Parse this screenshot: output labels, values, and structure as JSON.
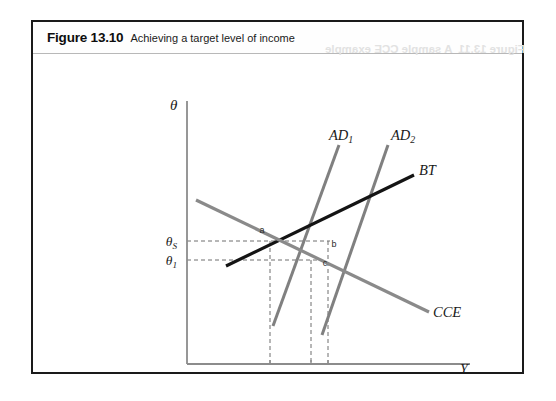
{
  "figure": {
    "number": "Figure 13.10",
    "title": "Achieving a target level of income",
    "bleed_through_text": "Figure 13.11  A sample CCE example"
  },
  "axes": {
    "y_axis_label": "θ",
    "x_axis_label": "Y",
    "axis_color": "#8c8c8c",
    "origin": [
      154,
      341
    ],
    "x_axis_end": [
      437,
      341
    ],
    "y_axis_top": [
      154,
      78
    ]
  },
  "y_ticks": [
    {
      "name": "theta-S",
      "label": "θ",
      "sub": "S",
      "y": 218,
      "label_x": 132
    },
    {
      "name": "theta-1",
      "label": "θ",
      "sub": "1",
      "y": 237,
      "label_x": 132
    }
  ],
  "x_ticks": [
    {
      "name": "Y-S",
      "label": "Y",
      "sub": "S",
      "x": 237,
      "label_y": 358
    },
    {
      "name": "Y-1",
      "label": "Y",
      "sub": "1",
      "x": 278,
      "label_y": 358
    },
    {
      "name": "Y-T",
      "label": "Y",
      "sub": "T",
      "x": 295,
      "label_y": 358
    }
  ],
  "curves": [
    {
      "id": "AD1",
      "label": "AD",
      "sub": "1",
      "color": "#808080",
      "width": 3,
      "x1": 240,
      "y1": 303,
      "x2": 306,
      "y2": 122,
      "label_x": 296,
      "label_y": 117
    },
    {
      "id": "AD2",
      "label": "AD",
      "sub": "2",
      "color": "#808080",
      "width": 3,
      "x1": 289,
      "y1": 312,
      "x2": 355,
      "y2": 122,
      "label_x": 358,
      "label_y": 117
    },
    {
      "id": "BT",
      "label": "BT",
      "sub": "",
      "color": "#141414",
      "width": 3.2,
      "x1": 193,
      "y1": 243,
      "x2": 381,
      "y2": 152,
      "label_x": 386,
      "label_y": 152
    },
    {
      "id": "CCE",
      "label": "CCE",
      "sub": "",
      "color": "#8a8a8a",
      "width": 3.2,
      "x1": 163,
      "y1": 177,
      "x2": 396,
      "y2": 289,
      "label_x": 400,
      "label_y": 294
    }
  ],
  "points": [
    {
      "id": "a",
      "label": "a",
      "x": 237,
      "y": 218,
      "label_x": 229,
      "label_y": 210
    },
    {
      "id": "b",
      "label": "b",
      "x": 297,
      "y": 218,
      "label_x": 301,
      "label_y": 224
    },
    {
      "id": "c",
      "label": "c",
      "x": 288,
      "y": 237,
      "label_x": 292,
      "label_y": 243
    }
  ],
  "guides": {
    "color": "#6e6e6e",
    "dash": "4,3",
    "horizontal": [
      {
        "name": "theta-S-guide",
        "x1": 154,
        "x2": 297,
        "y": 218
      },
      {
        "name": "theta-1-guide",
        "x1": 154,
        "x2": 288,
        "y": 237
      }
    ],
    "vertical": [
      {
        "name": "Y-S-guide",
        "x": 237,
        "y1": 218,
        "y2": 341
      },
      {
        "name": "Y-1-guide",
        "x": 278,
        "y1": 237,
        "y2": 341
      },
      {
        "name": "Y-T-guide",
        "x": 295,
        "y1": 218,
        "y2": 341
      }
    ]
  }
}
